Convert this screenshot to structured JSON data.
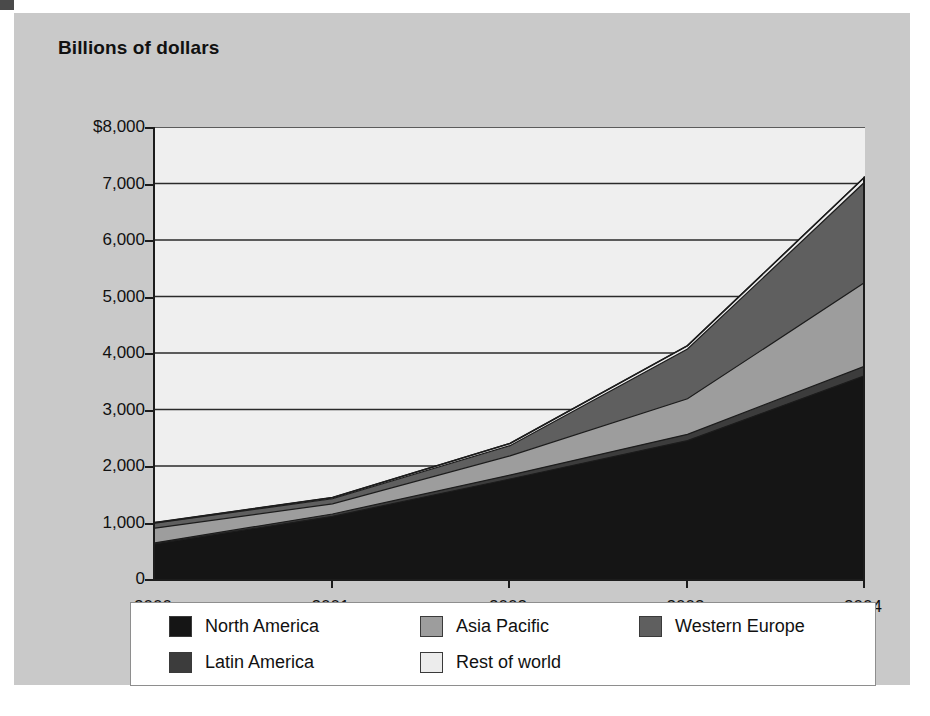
{
  "figure": {
    "title": "Billions of dollars"
  },
  "chart_data": {
    "type": "area",
    "stacked": true,
    "title": "Billions of dollars",
    "xlabel": "",
    "ylabel": "Billions of dollars",
    "categories": [
      "2000",
      "2001",
      "2002",
      "2003",
      "2004"
    ],
    "x": [
      2000,
      2001,
      2002,
      2003,
      2004
    ],
    "ylim": [
      0,
      8000
    ],
    "ytick_labels": [
      "$8,000",
      "7,000",
      "6,000",
      "5,000",
      "4,000",
      "3,000",
      "2,000",
      "1,000",
      "0"
    ],
    "yticks": [
      8000,
      7000,
      6000,
      5000,
      4000,
      3000,
      2000,
      1000,
      0
    ],
    "grid": true,
    "legend_position": "bottom",
    "series": [
      {
        "name": "North America",
        "color": "#151515",
        "values": [
          620,
          1110,
          1770,
          2450,
          3600
        ]
      },
      {
        "name": "Latin America",
        "color": "#3c3c3c",
        "values": [
          20,
          40,
          70,
          110,
          170
        ]
      },
      {
        "name": "Asia Pacific",
        "color": "#9d9d9d",
        "values": [
          260,
          180,
          340,
          630,
          1480
        ]
      },
      {
        "name": "Western Europe",
        "color": "#5f5f5f",
        "values": [
          90,
          90,
          180,
          880,
          1780
        ]
      },
      {
        "name": "Rest of world",
        "color": "#ececec",
        "values": [
          10,
          20,
          40,
          60,
          90
        ]
      }
    ],
    "totals": [
      1000,
      1440,
      2400,
      4130,
      7120
    ],
    "annotations": []
  },
  "legend": {
    "rows": [
      [
        {
          "label": "North America",
          "color": "#151515"
        },
        {
          "label": "Asia Pacific",
          "color": "#9d9d9d"
        },
        {
          "label": "Western Europe",
          "color": "#5f5f5f"
        }
      ],
      [
        {
          "label": "Latin America",
          "color": "#3c3c3c"
        },
        {
          "label": "Rest of world",
          "color": "#ececec"
        }
      ]
    ]
  }
}
